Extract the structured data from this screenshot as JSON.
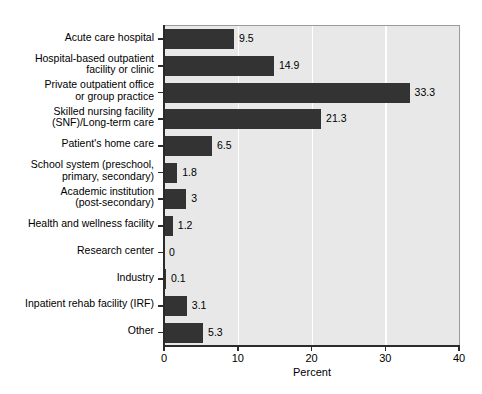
{
  "chart_data": {
    "type": "bar",
    "orientation": "horizontal",
    "title": "",
    "xlabel": "Percent",
    "ylabel": "",
    "xlim": [
      0,
      40
    ],
    "xticks": [
      0,
      10,
      20,
      30,
      40
    ],
    "xtick_labels": [
      "0",
      "10",
      "20",
      "30",
      "40"
    ],
    "grid": "vertical-white-gridlines-at-10-20-30",
    "legend": "none",
    "categories": [
      "Acute care hospital",
      "Hospital-based outpatient\nfacility or clinic",
      "Private outpatient office\nor group practice",
      "Skilled nursing facility\n(SNF)/Long-term care",
      "Patient's home care",
      "School system (preschool,\nprimary, secondary)",
      "Academic institution\n(post-secondary)",
      "Health and wellness facility",
      "Research center",
      "Industry",
      "Inpatient rehab facility (IRF)",
      "Other"
    ],
    "values": [
      9.5,
      14.9,
      33.3,
      21.3,
      6.5,
      1.8,
      3,
      1.2,
      0,
      0.1,
      3.1,
      5.3
    ],
    "value_labels": [
      "9.5",
      "14.9",
      "33.3",
      "21.3",
      "6.5",
      "1.8",
      "3",
      "1.2",
      "0",
      "0.1",
      "3.1",
      "5.3"
    ],
    "colors": {
      "bar": "#333333",
      "plot_background": "#e8e8e8",
      "gridline": "#ffffff",
      "axis": "#2b2b2b",
      "text": "#000000",
      "page_background": "#ffffff"
    }
  }
}
